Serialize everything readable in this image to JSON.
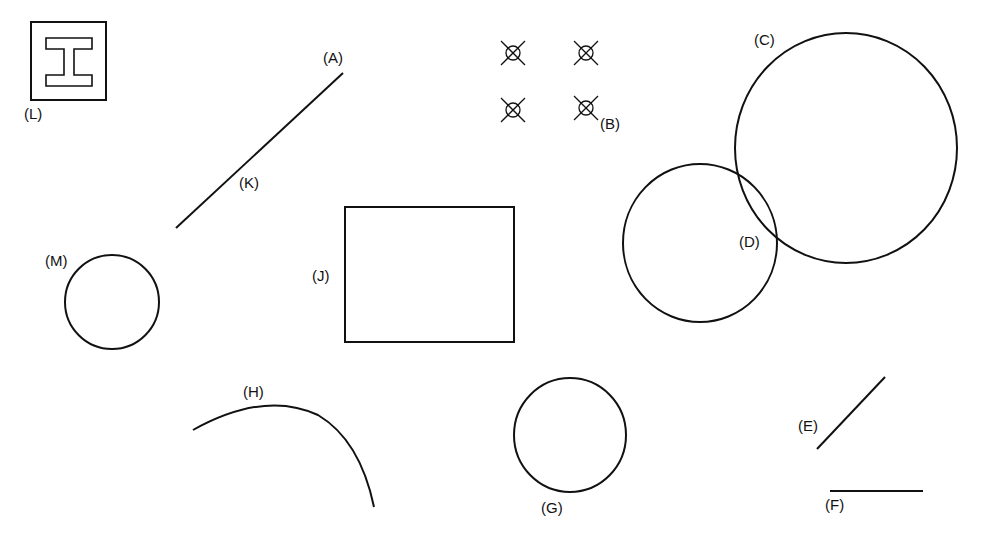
{
  "diagram": {
    "stroke_color": "#111111",
    "background": "#ffffff",
    "labels": {
      "A": "(A)",
      "B": "(B)",
      "C": "(C)",
      "D": "(D)",
      "E": "(E)",
      "F": "(F)",
      "G": "(G)",
      "H": "(H)",
      "J": "(J)",
      "K": "(K)",
      "L": "(L)",
      "M": "(M)"
    },
    "objects": [
      {
        "id": "L",
        "type": "block-ibeam-symbol",
        "label": "(L)"
      },
      {
        "id": "A",
        "type": "line-endpoint",
        "label": "(A)"
      },
      {
        "id": "K",
        "type": "line-midpoint",
        "label": "(K)"
      },
      {
        "id": "B",
        "type": "node-points-grid",
        "count": 4,
        "label": "(B)"
      },
      {
        "id": "C",
        "type": "circle-large",
        "label": "(C)"
      },
      {
        "id": "D",
        "type": "intersection",
        "label": "(D)"
      },
      {
        "id": "J",
        "type": "rectangle",
        "label": "(J)"
      },
      {
        "id": "M",
        "type": "circle",
        "label": "(M)"
      },
      {
        "id": "H",
        "type": "arc",
        "label": "(H)"
      },
      {
        "id": "G",
        "type": "circle",
        "label": "(G)"
      },
      {
        "id": "E",
        "type": "diagonal-line",
        "label": "(E)"
      },
      {
        "id": "F",
        "type": "horizontal-line",
        "label": "(F)"
      }
    ]
  }
}
